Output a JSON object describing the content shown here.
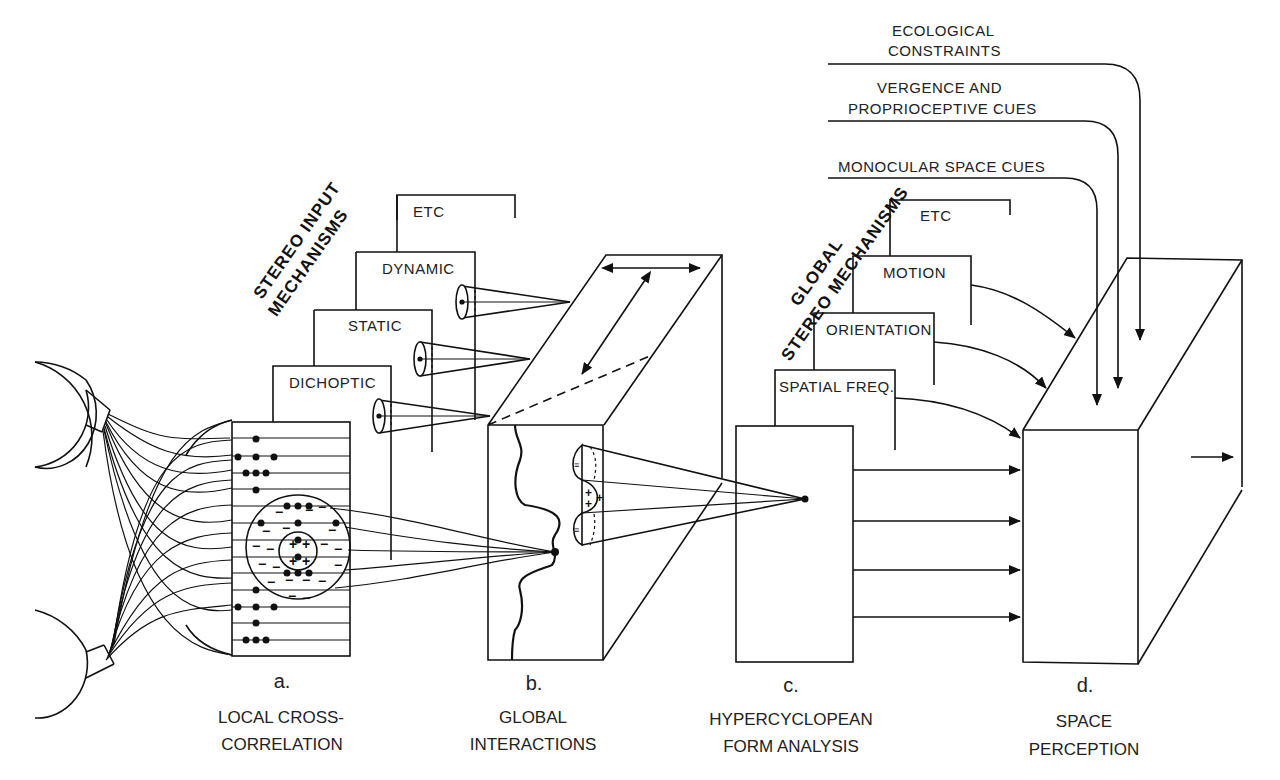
{
  "figure": {
    "stages": [
      {
        "letter": "a.",
        "caption_line1": "LOCAL CROSS-",
        "caption_line2": "CORRELATION"
      },
      {
        "letter": "b.",
        "caption_line1": "GLOBAL",
        "caption_line2": "INTERACTIONS"
      },
      {
        "letter": "c.",
        "caption_line1": "HYPERCYCLOPEAN",
        "caption_line2": "FORM ANALYSIS"
      },
      {
        "letter": "d.",
        "caption_line1": "SPACE",
        "caption_line2": "PERCEPTION"
      }
    ],
    "stereo_input": {
      "heading_line1": "STEREO INPUT",
      "heading_line2": "MECHANISMS",
      "boxes": [
        "DICHOPTIC",
        "STATIC",
        "DYNAMIC",
        "ETC"
      ]
    },
    "global_stereo": {
      "heading_line1": "GLOBAL",
      "heading_line2": "STEREO MECHANISMS",
      "boxes": [
        "SPATIAL FREQ.",
        "ORIENTATION",
        "MOTION",
        "ETC"
      ]
    },
    "external_cues": [
      {
        "line1": "ECOLOGICAL",
        "line2": "CONSTRAINTS"
      },
      {
        "line1": "VERGENCE AND",
        "line2": "PROPRIOCEPTIVE CUES"
      },
      {
        "line1": "MONOCULAR SPACE CUES",
        "line2": ""
      }
    ],
    "receptive_field_signs": {
      "plus": "+",
      "minus": "−",
      "triple": "≡"
    }
  }
}
